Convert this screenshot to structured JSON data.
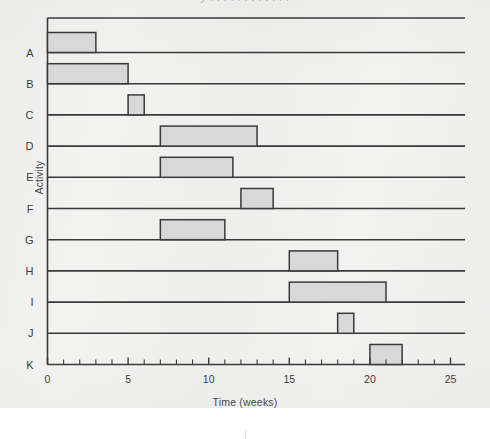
{
  "page": {
    "background_color": "#f2f2f1",
    "card_color": "#ffffff",
    "top_cut_text": "y  . .  .  .  .   .  .  .  .  .   .  ."
  },
  "chart_data": {
    "type": "bar",
    "orientation": "horizontal",
    "subtype": "gantt",
    "title": "",
    "xlabel": "Time (weeks)",
    "ylabel": "Activity",
    "xlim": [
      0,
      25
    ],
    "ylim_categories": [
      "A",
      "B",
      "C",
      "D",
      "E",
      "F",
      "G",
      "H",
      "I",
      "J",
      "K"
    ],
    "categories": [
      "A",
      "B",
      "C",
      "D",
      "E",
      "F",
      "G",
      "H",
      "I",
      "J",
      "K"
    ],
    "xticks": [
      0,
      5,
      10,
      15,
      20,
      25
    ],
    "xtick_labels": [
      "0",
      "5",
      "10",
      "15",
      "20",
      "25"
    ],
    "minor_tick_interval": 1,
    "grid": false,
    "baselines": true,
    "legend": "none",
    "bar_fill_color": "#d8d8d8",
    "bar_edge_color": "#3a3a3a",
    "axis_color": "#3a3a3a",
    "bars": [
      {
        "activity": "A",
        "start": 0,
        "end": 3,
        "duration": 3
      },
      {
        "activity": "B",
        "start": 0,
        "end": 5,
        "duration": 5
      },
      {
        "activity": "C",
        "start": 5,
        "end": 6,
        "duration": 1
      },
      {
        "activity": "D",
        "start": 7,
        "end": 13,
        "duration": 6
      },
      {
        "activity": "E",
        "start": 7,
        "end": 11.5,
        "duration": 4.5
      },
      {
        "activity": "F",
        "start": 12,
        "end": 14,
        "duration": 2
      },
      {
        "activity": "G",
        "start": 7,
        "end": 11,
        "duration": 4
      },
      {
        "activity": "H",
        "start": 15,
        "end": 18,
        "duration": 3
      },
      {
        "activity": "I",
        "start": 15,
        "end": 21,
        "duration": 6
      },
      {
        "activity": "J",
        "start": 18,
        "end": 19,
        "duration": 1
      },
      {
        "activity": "K",
        "start": 20,
        "end": 22,
        "duration": 2
      }
    ]
  }
}
